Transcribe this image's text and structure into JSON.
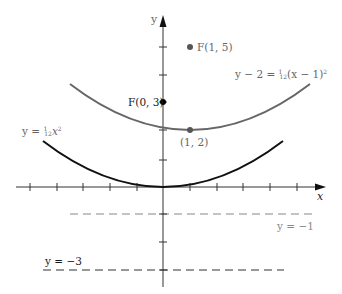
{
  "figure": {
    "axes": {
      "x_label": "x",
      "y_label": "y",
      "unit_px": 26.7,
      "origin_px": [
        163,
        187
      ],
      "x_ticks": [
        -5,
        -4,
        -3,
        -2,
        -1,
        1,
        2,
        3,
        4,
        5
      ],
      "y_ticks": [
        -3,
        -2,
        -1,
        1,
        2,
        3,
        4,
        5
      ]
    },
    "curves": [
      {
        "name": "parabola-base",
        "equation_label": "y = ¹⁄₁₂x²",
        "label_prefix": "y = ",
        "label_frac_num": "1",
        "label_frac_den": "12",
        "label_suffix": "x",
        "label_exp": "2",
        "vertex": [
          0,
          0
        ],
        "coefficient": "1/12",
        "color": "#111111"
      },
      {
        "name": "parabola-shifted",
        "equation_label": "y − 2 = ¹⁄₁₂(x − 1)²",
        "label_prefix": "y − 2 = ",
        "label_frac_num": "1",
        "label_frac_den": "12",
        "label_suffix": "(x − 1)",
        "label_exp": "2",
        "vertex": [
          1,
          2
        ],
        "coefficient": "1/12",
        "color": "#555555"
      }
    ],
    "points": [
      {
        "name": "focus-base",
        "label": "F(0, 3)",
        "x": 0,
        "y": 3,
        "color": "#000000"
      },
      {
        "name": "focus-shifted",
        "label": "F(1, 5)",
        "x": 1,
        "y": 5,
        "color": "#555555"
      },
      {
        "name": "vertex-shifted",
        "label": "(1, 2)",
        "x": 1,
        "y": 2,
        "color": "#555555"
      }
    ],
    "directrices": [
      {
        "name": "directrix-shifted",
        "label": "y = −1",
        "y": -1,
        "color": "#777777"
      },
      {
        "name": "directrix-base",
        "label": "y = −3",
        "y": -3,
        "color": "#333333"
      }
    ]
  }
}
